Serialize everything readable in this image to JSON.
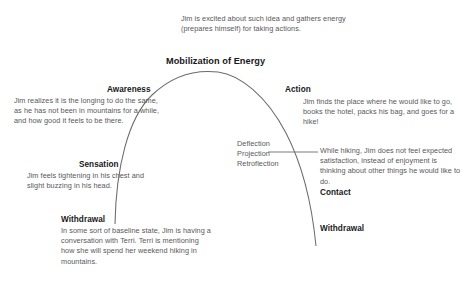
{
  "diagram": {
    "stroke_color": "#6b6b6d",
    "text_color": "#58585a",
    "heading_color": "#17181a",
    "background": "#ffffff"
  },
  "apex": {
    "description": "Jim is excited about such idea and gathers energy (prepares himself) for taking actions.",
    "heading": "Mobilization of Energy"
  },
  "left_side": {
    "awareness": {
      "heading": "Awareness",
      "description": "Jim realizes it is the longing to do the same, as he has not been in mountains for a while, and how good it feels to be there."
    },
    "sensation": {
      "heading": "Sensation",
      "description": "Jim feels tightening in his chest and slight buzzing in his head."
    },
    "withdrawal": {
      "heading": "Withdrawal",
      "description": "In some sort of baseline state, Jim is having a conversation with Terri. Terri is mentioning how she will spend her weekend hiking in mountains."
    }
  },
  "right_side": {
    "action": {
      "heading": "Action",
      "description": "Jim finds the place where he would like to go, books the hotel, packs his bag, and goes for a hike!"
    },
    "resistances": {
      "label": "Deflection\nProjection\nRetroflection"
    },
    "contact": {
      "heading": "Contact",
      "description": "While hiking, Jim does not feel expected satisfaction, instead of enjoyment is thinking about other things he would like to do."
    },
    "withdrawal": {
      "heading": "Withdrawal"
    }
  }
}
